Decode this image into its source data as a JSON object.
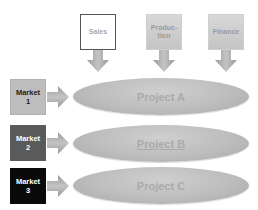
{
  "departments": [
    {
      "label": "Sales",
      "style": "white"
    },
    {
      "label": "Produc-\ntion",
      "style": "gray"
    },
    {
      "label": "Finance",
      "style": "gray"
    }
  ],
  "markets": [
    {
      "label": "Market\n1",
      "bg": "#bdbdbd",
      "fg": "#222222"
    },
    {
      "label": "Market\n2",
      "bg": "#5a5a5a",
      "fg": "#ffffff"
    },
    {
      "label": "Market\n3",
      "bg": "#0a0a0a",
      "fg": "#ffffff"
    }
  ],
  "projects": [
    {
      "label": "Project A",
      "underlined": false
    },
    {
      "label": "Project B",
      "underlined": true
    },
    {
      "label": "Project C",
      "underlined": false
    }
  ],
  "colors": {
    "arrow": "#a8a8a8",
    "ellipse": "#bdbdbd"
  }
}
